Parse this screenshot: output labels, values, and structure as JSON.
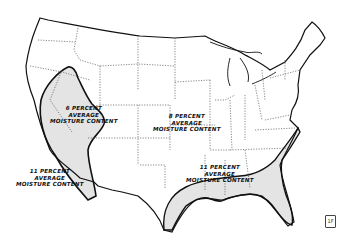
{
  "map": {
    "title": "United States average moisture content zones",
    "zones": [
      {
        "id": "west",
        "line1": "6 PERCENT",
        "line2": "AVERAGE",
        "line3": "MOISTURE CONTENT",
        "shaded": true
      },
      {
        "id": "interior",
        "line1": "8 PERCENT",
        "line2": "AVERAGE",
        "line3": "MOISTURE CONTENT",
        "shaded": false
      },
      {
        "id": "coast-pacific",
        "line1": "11 PERCENT",
        "line2": "AVERAGE",
        "line3": "MOISTURE CONTENT",
        "shaded": false
      },
      {
        "id": "gulf-southeast",
        "line1": "11 PERCENT",
        "line2": "AVERAGE",
        "line3": "MOISTURE CONTENT",
        "shaded": true
      }
    ],
    "colors": {
      "shade": "#e4e4e4",
      "outline": "#111111",
      "border": "#555555"
    },
    "stamp": "1F"
  }
}
